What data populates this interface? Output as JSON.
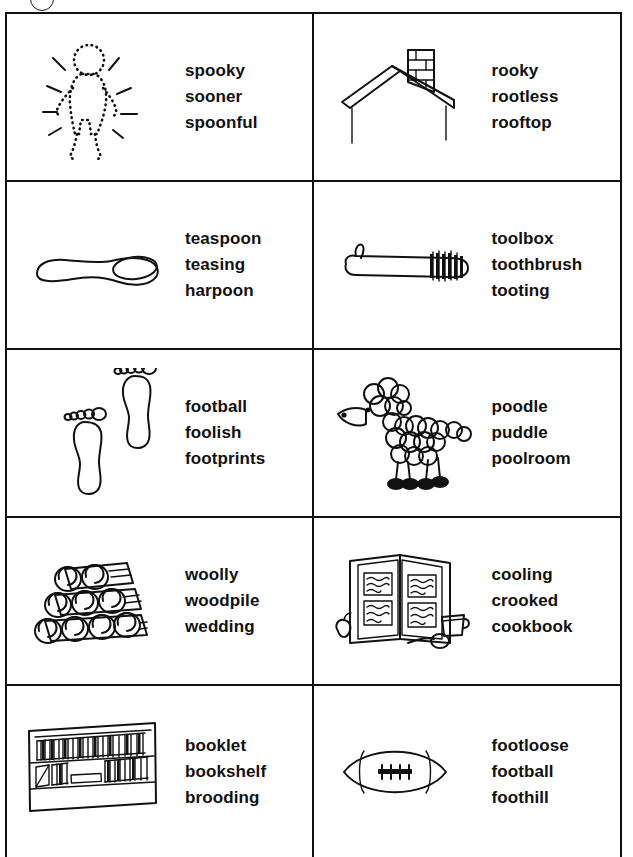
{
  "page": {
    "marker_label": ""
  },
  "worksheet": {
    "rows": [
      {
        "left": {
          "picture": "glowing-ghost-figure-icon",
          "words": [
            "spooky",
            "sooner",
            "spoonful"
          ]
        },
        "right": {
          "picture": "rooftop-with-chimney-icon",
          "words": [
            "rooky",
            "rootless",
            "rooftop"
          ]
        }
      },
      {
        "left": {
          "picture": "spoon-icon",
          "words": [
            "teaspoon",
            "teasing",
            "harpoon"
          ]
        },
        "right": {
          "picture": "toothbrush-icon",
          "words": [
            "toolbox",
            "toothbrush",
            "tooting"
          ]
        }
      },
      {
        "left": {
          "picture": "footprints-icon",
          "words": [
            "football",
            "foolish",
            "footprints"
          ]
        },
        "right": {
          "picture": "poodle-icon",
          "words": [
            "poodle",
            "puddle",
            "poolroom"
          ]
        }
      },
      {
        "left": {
          "picture": "woodpile-icon",
          "words": [
            "woolly",
            "woodpile",
            "wedding"
          ]
        },
        "right": {
          "picture": "open-cookbook-icon",
          "words": [
            "cooling",
            "crooked",
            "cookbook"
          ]
        }
      },
      {
        "left": {
          "picture": "bookshelf-icon",
          "words": [
            "booklet",
            "bookshelf",
            "brooding"
          ]
        },
        "right": {
          "picture": "football-icon",
          "words": [
            "footloose",
            "football",
            "foothill"
          ]
        }
      }
    ]
  },
  "colors": {
    "ink": "#111111",
    "paper": "#ffffff"
  }
}
